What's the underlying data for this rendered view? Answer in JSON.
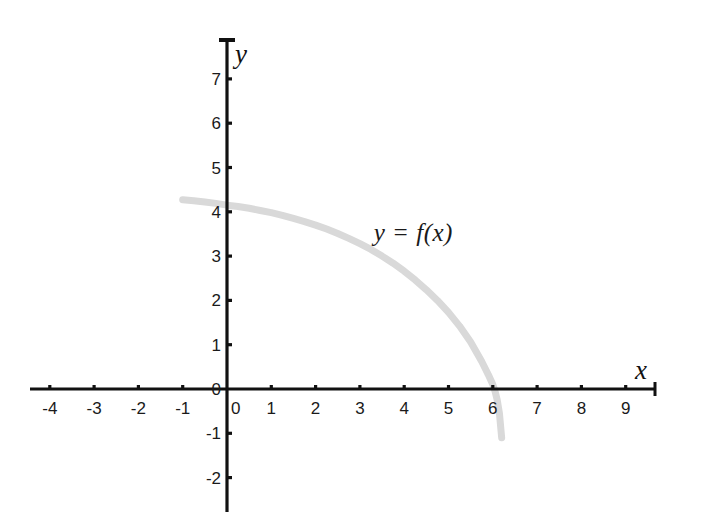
{
  "figure": {
    "background_color": "#ffffff",
    "axis_color": "#111111",
    "curve_color": "#d9d9d9",
    "label_color": "#1a1a1a",
    "x_axis_name": "x",
    "y_axis_name": "y",
    "curve_label": "y = f(x)"
  },
  "chart_data": {
    "type": "line",
    "title": "",
    "xlabel": "x",
    "ylabel": "y",
    "xlim": [
      -4.5,
      9.7
    ],
    "ylim": [
      -2.5,
      7.6
    ],
    "xticks": [
      -4,
      -3,
      -2,
      -1,
      0,
      1,
      2,
      3,
      4,
      5,
      6,
      7,
      8,
      9
    ],
    "xtick_labels": [
      "-4",
      "-3",
      "-2",
      "-1",
      "0",
      "1",
      "2",
      "3",
      "4",
      "5",
      "6",
      "7",
      "8",
      "9"
    ],
    "yticks": [
      -2,
      -1,
      0,
      1,
      2,
      3,
      4,
      5,
      6,
      7
    ],
    "ytick_labels": [
      "-2",
      "-1",
      "0",
      "1",
      "2",
      "3",
      "4",
      "5",
      "6",
      "7"
    ],
    "grid": false,
    "legend": "none",
    "annotations": [
      {
        "text": "y = f(x)",
        "x": 3.9,
        "y": 3.55
      }
    ],
    "series": [
      {
        "name": "y = f(x)",
        "color": "#d9d9d9",
        "line_width": 7,
        "x": [
          -1.0,
          -0.75,
          -0.5,
          -0.25,
          0.0,
          0.25,
          0.5,
          0.75,
          1.0,
          1.25,
          1.5,
          1.75,
          2.0,
          2.25,
          2.5,
          2.75,
          3.0,
          3.25,
          3.5,
          3.75,
          4.0,
          4.25,
          4.5,
          4.75,
          5.0,
          5.25,
          5.5,
          5.75,
          5.9,
          6.0,
          6.05,
          6.1,
          6.15,
          6.2
        ],
        "y": [
          4.27,
          4.25,
          4.22,
          4.19,
          4.15,
          4.12,
          4.08,
          4.03,
          3.98,
          3.92,
          3.85,
          3.78,
          3.7,
          3.61,
          3.51,
          3.4,
          3.28,
          3.15,
          3.0,
          2.84,
          2.66,
          2.46,
          2.24,
          2.0,
          1.73,
          1.42,
          1.06,
          0.62,
          0.32,
          0.1,
          -0.05,
          -0.25,
          -0.55,
          -1.1
        ]
      }
    ]
  },
  "axes_geometry": {
    "origin_x_px": 227,
    "origin_y_px": 389,
    "unit_px": 44.3,
    "x_axis_start_px": 30,
    "x_axis_end_px": 655,
    "y_axis_top_px": 40,
    "y_axis_bottom_px": 512
  }
}
